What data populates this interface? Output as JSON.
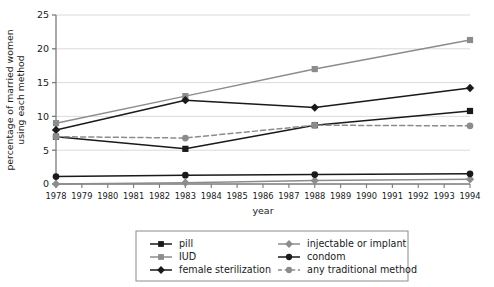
{
  "chart_data": {
    "type": "line",
    "title": "",
    "xlabel": "year",
    "ylabel": "percentage of married women using each method",
    "xlim": [
      1978,
      1994
    ],
    "ylim": [
      0,
      25
    ],
    "ytick_labels": [
      "0",
      "5",
      "10",
      "15",
      "20",
      "25"
    ],
    "ytick_values": [
      0,
      5,
      10,
      15,
      20,
      25
    ],
    "xtick_labels": [
      "1978",
      "1979",
      "1980",
      "1981",
      "1982",
      "1983",
      "1984",
      "1985",
      "1986",
      "1987",
      "1988",
      "1989",
      "1990",
      "1991",
      "1992",
      "1993",
      "1994"
    ],
    "xtick_values": [
      1978,
      1979,
      1980,
      1981,
      1982,
      1983,
      1984,
      1985,
      1986,
      1987,
      1988,
      1989,
      1990,
      1991,
      1992,
      1993,
      1994
    ],
    "x": [
      1978,
      1983,
      1988,
      1994
    ],
    "grid": "horizontal",
    "legend_position": "bottom",
    "series": [
      {
        "name": "pill",
        "values": [
          7.0,
          5.2,
          8.7,
          10.8
        ],
        "color": "#1a1a1a",
        "marker": "square",
        "dash": "solid"
      },
      {
        "name": "IUD",
        "values": [
          9.0,
          13.0,
          17.0,
          21.3
        ],
        "color": "#8c8c8c",
        "marker": "square",
        "dash": "solid"
      },
      {
        "name": "female sterilization",
        "values": [
          8.0,
          12.4,
          11.3,
          14.2
        ],
        "color": "#1a1a1a",
        "marker": "diamond",
        "dash": "solid"
      },
      {
        "name": "injectable or implant",
        "values": [
          0.0,
          0.2,
          0.5,
          0.7
        ],
        "color": "#8c8c8c",
        "marker": "diamond",
        "dash": "solid"
      },
      {
        "name": "condom",
        "values": [
          1.1,
          1.3,
          1.4,
          1.5
        ],
        "color": "#1a1a1a",
        "marker": "circle",
        "dash": "solid"
      },
      {
        "name": "any traditional method",
        "values": [
          7.0,
          6.8,
          8.7,
          8.6
        ],
        "color": "#8c8c8c",
        "marker": "circle",
        "dash": "dashed"
      }
    ]
  },
  "axes": {
    "ylabel_line1": "percentage of married women",
    "ylabel_line2": "using each method",
    "xlabel": "year"
  },
  "legend": {
    "entries": [
      {
        "label": "pill"
      },
      {
        "label": "IUD"
      },
      {
        "label": "female sterilization"
      },
      {
        "label": "injectable or implant"
      },
      {
        "label": "condom"
      },
      {
        "label": "any traditional method"
      }
    ]
  },
  "colors": {
    "black": "#1a1a1a",
    "gray": "#8c8c8c",
    "grid": "#d6d6d6",
    "axis": "#7a7a7a",
    "background": "#ffffff"
  }
}
